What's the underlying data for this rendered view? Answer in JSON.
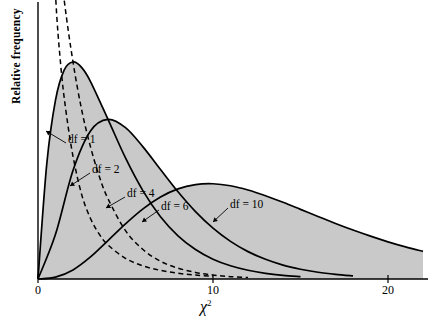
{
  "chart_data": {
    "type": "line",
    "title": "",
    "subtitle": "",
    "xlabel": "χ²",
    "ylabel": "Relative frequency",
    "xlim": [
      0,
      23
    ],
    "ylim": [
      0,
      0.5
    ],
    "xticks": [
      0,
      10,
      20
    ],
    "xtick_labels": [
      "0",
      "10",
      "20"
    ],
    "yticks": [],
    "ytick_labels": [],
    "grid": false,
    "legend_position": "inline-annotations",
    "fill_color": "#c9c9c9",
    "line_color": "#000000",
    "background_color": "#ffffff",
    "annotations": [
      {
        "text": "df = 1",
        "x": 2.05,
        "y": 0.212
      },
      {
        "text": "df = 2",
        "x": 3.45,
        "y": 0.163
      },
      {
        "text": "df = 4",
        "x": 5.35,
        "y": 0.125
      },
      {
        "text": "df = 6",
        "x": 9.15,
        "y": 0.103
      },
      {
        "text": "df = 10",
        "x": 14.0,
        "y": 0.096
      }
    ],
    "series": [
      {
        "name": "df = 1",
        "df": 1,
        "style": "dashed",
        "filled": false,
        "x": [
          0.08,
          0.15,
          0.25,
          0.4,
          0.6,
          0.8,
          1.0,
          1.3,
          1.6,
          2.0,
          2.5,
          3.0,
          3.5,
          4.0,
          5.0,
          6.0,
          7.0,
          8.0,
          9.0,
          10.0
        ],
        "y": [
          1.2,
          0.91,
          0.7,
          0.537,
          0.412,
          0.338,
          0.242,
          0.181,
          0.142,
          0.104,
          0.0713,
          0.0513,
          0.038,
          0.0288,
          0.0175,
          0.0111,
          0.0073,
          0.0049,
          0.0033,
          0.0024
        ]
      },
      {
        "name": "df = 2",
        "df": 2,
        "style": "dashed",
        "filled": false,
        "x": [
          0.0,
          0.5,
          1.0,
          1.5,
          2.0,
          2.5,
          3.0,
          3.5,
          4.0,
          5.0,
          6.0,
          7.0,
          8.0,
          9.0,
          10.0,
          11.0,
          12.0
        ],
        "y": [
          0.5,
          0.389,
          0.303,
          0.236,
          0.184,
          0.143,
          0.112,
          0.087,
          0.068,
          0.041,
          0.025,
          0.015,
          0.0092,
          0.0056,
          0.0034,
          0.002,
          0.0012
        ]
      },
      {
        "name": "df = 4",
        "df": 4,
        "style": "solid",
        "filled": true,
        "x": [
          0.0,
          0.5,
          1.0,
          1.5,
          2.0,
          2.5,
          3.0,
          4.0,
          5.0,
          6.0,
          7.0,
          8.0,
          9.0,
          10.0,
          11.0,
          12.0,
          13.0,
          14.0,
          15.0
        ],
        "y": [
          0.0,
          0.0973,
          0.1516,
          0.1772,
          0.1839,
          0.1791,
          0.1673,
          0.1353,
          0.1026,
          0.0747,
          0.0528,
          0.0366,
          0.025,
          0.0168,
          0.0112,
          0.0074,
          0.0048,
          0.0031,
          0.002
        ]
      },
      {
        "name": "df = 6",
        "df": 6,
        "style": "solid",
        "filled": true,
        "x": [
          0.0,
          1.0,
          2.0,
          3.0,
          4.0,
          5.0,
          6.0,
          7.0,
          8.0,
          9.0,
          10.0,
          11.0,
          12.0,
          13.0,
          14.0,
          15.0,
          16.0,
          17.0,
          18.0
        ],
        "y": [
          0.0,
          0.0379,
          0.092,
          0.1255,
          0.1353,
          0.1283,
          0.112,
          0.0928,
          0.0739,
          0.0571,
          0.0431,
          0.0319,
          0.0232,
          0.0167,
          0.0118,
          0.0083,
          0.0057,
          0.0039,
          0.0026
        ]
      },
      {
        "name": "df = 10",
        "df": 10,
        "style": "solid",
        "filled": true,
        "x": [
          0.0,
          1.0,
          2.0,
          3.0,
          4.0,
          5.0,
          6.0,
          7.0,
          8.0,
          9.0,
          10.0,
          11.0,
          12.0,
          13.0,
          14.0,
          15.0,
          16.0,
          17.0,
          18.0,
          19.0,
          20.0,
          21.0,
          22.0
        ],
        "y": [
          0.0,
          0.0016,
          0.0077,
          0.0187,
          0.0326,
          0.0467,
          0.0594,
          0.0695,
          0.0764,
          0.08,
          0.0807,
          0.079,
          0.0754,
          0.0706,
          0.065,
          0.059,
          0.053,
          0.0471,
          0.0415,
          0.0363,
          0.0315,
          0.0272,
          0.0234
        ]
      }
    ]
  },
  "axes": {
    "y_axis_title": "Relative frequency",
    "x_axis_title_base": "χ",
    "x_axis_title_sup": "2",
    "ticks": [
      {
        "label": "0",
        "value": 0
      },
      {
        "label": "10",
        "value": 10
      },
      {
        "label": "20",
        "value": 20
      }
    ]
  },
  "labels": {
    "df1": "df = 1",
    "df2": "df = 2",
    "df4": "df = 4",
    "df6": "df = 6",
    "df10": "df = 10"
  }
}
